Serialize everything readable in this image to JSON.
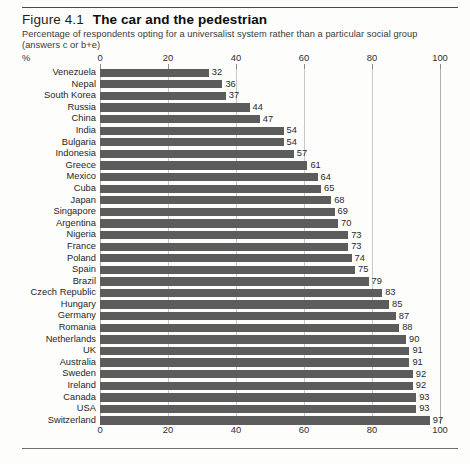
{
  "figure": {
    "number": "Figure 4.1",
    "title": "The car and the pedestrian",
    "subtitle": "Percentage of respondents opting for a universalist system rather than a particular social group (answers c or b+e)",
    "unit_mark": "%"
  },
  "chart_data": {
    "type": "bar",
    "orientation": "horizontal",
    "title": "The car and the pedestrian",
    "subtitle": "Percentage of respondents opting for a universalist system rather than a particular social group (answers c or b+e)",
    "xlabel": "%",
    "ylabel": "",
    "xlim": [
      0,
      100
    ],
    "xticks": [
      0,
      20,
      40,
      60,
      80,
      100
    ],
    "xtick_labels": [
      "0",
      "20",
      "40",
      "60",
      "80",
      "100"
    ],
    "grid": true,
    "legend": "none",
    "axis_positions": [
      "top",
      "bottom"
    ],
    "bar_color": "#5c5c5c",
    "categories": [
      "Venezuela",
      "Nepal",
      "South Korea",
      "Russia",
      "China",
      "India",
      "Bulgaria",
      "Indonesia",
      "Greece",
      "Mexico",
      "Cuba",
      "Japan",
      "Singapore",
      "Argentina",
      "Nigeria",
      "France",
      "Poland",
      "Spain",
      "Brazil",
      "Czech Republic",
      "Hungary",
      "Germany",
      "Romania",
      "Netherlands",
      "UK",
      "Australia",
      "Sweden",
      "Ireland",
      "Canada",
      "USA",
      "Switzerland"
    ],
    "values": [
      32,
      36,
      37,
      44,
      47,
      54,
      54,
      57,
      61,
      64,
      65,
      68,
      69,
      70,
      73,
      73,
      74,
      75,
      79,
      83,
      85,
      87,
      88,
      90,
      91,
      91,
      92,
      92,
      93,
      93,
      97
    ],
    "value_labels": [
      "32",
      "36",
      "37",
      "44",
      "47",
      "54",
      "54",
      "57",
      "61",
      "64",
      "65",
      "68",
      "69",
      "70",
      "73",
      "73",
      "74",
      "75",
      "79",
      "83",
      "85",
      "87",
      "88",
      "90",
      "91",
      "91",
      "92",
      "92",
      "93",
      "93",
      "97"
    ]
  }
}
